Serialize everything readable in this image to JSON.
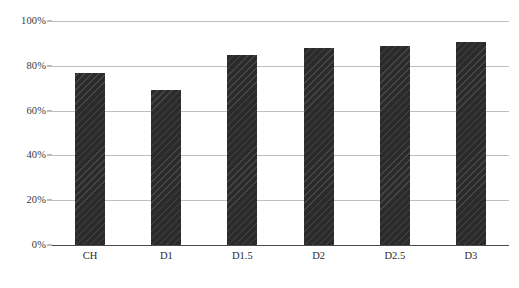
{
  "chart_data": {
    "type": "bar",
    "title": "",
    "subtitle": "",
    "xlabel": "",
    "ylabel": "",
    "categories": [
      "CH",
      "D1",
      "D1.5",
      "D2",
      "D2.5",
      "D3"
    ],
    "values": [
      77,
      69,
      85,
      88,
      89,
      90.5
    ],
    "value_labels": [
      "77%",
      "69%",
      "85%",
      "88%",
      "89%",
      "90.5%"
    ],
    "ylim": [
      0,
      100
    ],
    "ytick_values": [
      100,
      80,
      60,
      40,
      20,
      0
    ],
    "ytick_labels": [
      "100%",
      "80%",
      "60%",
      "40%",
      "20%",
      "0%"
    ],
    "grid": true,
    "grid_axis": "y",
    "legend": false,
    "legend_position": "none",
    "series": [
      {
        "name": "",
        "values": [
          77,
          69,
          85,
          88,
          89,
          90.5
        ]
      }
    ],
    "annotations": []
  },
  "style": {
    "bar_color": "#2b2b2b",
    "bar_pattern": "diagonal-hatch",
    "gridline_color": "#bfbfbf",
    "axis_color": "#4a4a4a",
    "background_color": "#ffffff",
    "tick_label_color": "#3a3a3a"
  }
}
